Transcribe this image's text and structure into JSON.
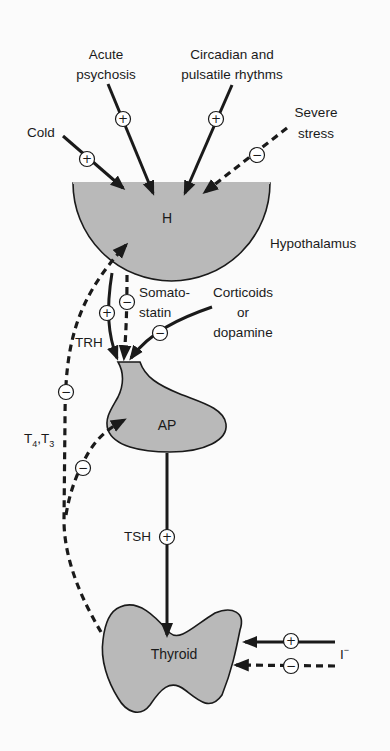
{
  "diagram": {
    "organs": {
      "hypothalamus": {
        "short": "H",
        "label": "Hypothalamus"
      },
      "pituitary": {
        "short": "AP"
      },
      "thyroid": {
        "label": "Thyroid"
      }
    },
    "inputs": {
      "cold": {
        "label": "Cold",
        "sign": "+"
      },
      "acute_psychosis": {
        "line1": "Acute",
        "line2": "psychosis",
        "sign": "+"
      },
      "circadian": {
        "line1": "Circadian and",
        "line2": "pulsatile rhythms",
        "sign": "+"
      },
      "severe_stress": {
        "line1": "Severe",
        "line2": "stress",
        "sign": "−"
      }
    },
    "pathways": {
      "trh": {
        "label": "TRH",
        "sign": "+"
      },
      "somatostatin": {
        "line1": "Somato-",
        "line2": "statin",
        "sign": "−"
      },
      "corticoids": {
        "line1": "Corticoids",
        "line2": "or",
        "line3": "dopamine",
        "sign": "−"
      },
      "tsh": {
        "label": "TSH",
        "sign": "+"
      },
      "t4t3_feedback_h": {
        "label_main": "T",
        "sub1": "4",
        "sep": ",T",
        "sub2": "3",
        "sign": "−"
      },
      "t4t3_feedback_ap": {
        "sign": "−"
      },
      "iodide_pos": {
        "sign": "+"
      },
      "iodide_neg": {
        "sign": "−"
      },
      "iodide": {
        "label": "I",
        "sup": "−"
      }
    },
    "colors": {
      "organ_fill": "#b9b9b9",
      "line": "#1a1a1a",
      "background": "#fbfbfb"
    }
  }
}
